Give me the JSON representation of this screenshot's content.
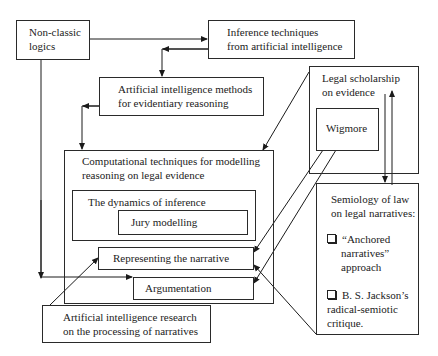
{
  "diagram": {
    "nodes": {
      "non_classic": {
        "line1": "Non-classic",
        "line2": "logics"
      },
      "inference_ai": {
        "line1": "Inference techniques",
        "line2": "from artificial intelligence"
      },
      "ai_methods": {
        "line1": "Artificial intelligence methods",
        "line2": "for evidentiary reasoning"
      },
      "legal_scholarship": {
        "line1": "Legal scholarship",
        "line2": "on evidence"
      },
      "wigmore": {
        "label": "Wigmore"
      },
      "computational": {
        "line1": "Computational techniques for modelling",
        "line2": "reasoning on legal evidence"
      },
      "dynamics": {
        "label": "The dynamics of inference"
      },
      "jury": {
        "label": "Jury modelling"
      },
      "representing": {
        "label": "Representing the narrative"
      },
      "argumentation": {
        "label": "Argumentation"
      },
      "ai_research": {
        "line1": "Artificial intelligence research",
        "line2": "on the processing of narratives"
      },
      "semiology": {
        "line1": "Semiology of law",
        "line2": "on legal narratives:",
        "item1": {
          "line1": "“Anchored",
          "line2": "narratives”",
          "line3": "approach"
        },
        "item2": {
          "line1": "B. S. Jackson’s",
          "line2": "radical-semiotic",
          "line3": "critique."
        }
      }
    },
    "edges": [
      {
        "from": "non_classic",
        "to": "inference_ai"
      },
      {
        "from": "non_classic",
        "to": "argumentation"
      },
      {
        "from": "inference_ai",
        "to": "ai_methods"
      },
      {
        "from": "ai_methods",
        "to": "computational"
      },
      {
        "from": "legal_scholarship",
        "to": "computational"
      },
      {
        "from": "legal_scholarship",
        "to": "semiology"
      },
      {
        "from": "semiology",
        "to": "legal_scholarship"
      },
      {
        "from": "wigmore",
        "to": "representing"
      },
      {
        "from": "wigmore",
        "to": "argumentation"
      },
      {
        "from": "semiology",
        "to": "representing"
      },
      {
        "from": "ai_research",
        "to": "representing"
      }
    ]
  }
}
